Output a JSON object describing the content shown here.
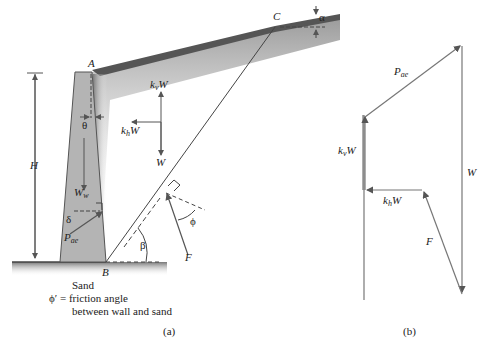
{
  "figure_a": {
    "caption": "(a)",
    "points": {
      "A": "A",
      "B": "B",
      "C": "C"
    },
    "height_label": "H",
    "wall_weight": {
      "main": "W",
      "sub": "w"
    },
    "theta": "θ",
    "delta": "δ",
    "alpha": "α",
    "beta": "β",
    "phi": "ϕ",
    "pae": {
      "main": "P",
      "sub": "ae"
    },
    "kvW": {
      "k": "k",
      "sub": "v",
      "W": "W"
    },
    "khW": {
      "k": "k",
      "sub": "h",
      "W": "W"
    },
    "weight": "W",
    "force_F": "F",
    "soil_label": "Sand",
    "friction_line1": "ϕ′ = friction angle",
    "friction_line2": "between wall and sand"
  },
  "figure_b": {
    "caption": "(b)",
    "pae": {
      "main": "P",
      "sub": "ae"
    },
    "kvW": {
      "k": "k",
      "sub": "v",
      "W": "W"
    },
    "khW": {
      "k": "k",
      "sub": "h",
      "W": "W"
    },
    "weight": "W",
    "force_F": "F"
  },
  "colors": {
    "wall_fill": "#b4b4b4",
    "line": "#555555",
    "ground_shade": "#8c8c8c"
  }
}
